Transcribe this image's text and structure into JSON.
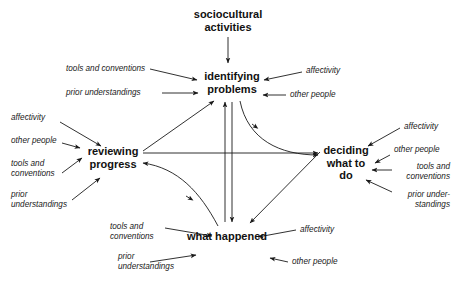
{
  "diagram": {
    "title_node": "sociocultural activities",
    "type": "cycle-diagram",
    "nodes": {
      "top": "sociocultural\nactivities",
      "identifying": "identifying\nproblems",
      "reviewing": "reviewing\nprogress",
      "deciding": "deciding\nwhat to\ndo",
      "happened": "what happened"
    },
    "node_lines": {
      "top_l1": "sociocultural",
      "top_l2": "activities",
      "identifying_l1": "identifying",
      "identifying_l2": "problems",
      "reviewing_l1": "reviewing",
      "reviewing_l2": "progress",
      "deciding_l1": "deciding",
      "deciding_l2": "what to",
      "deciding_l3": "do",
      "happened_l1": "what happened"
    },
    "influences": {
      "identifying_left": [
        "tools and conventions",
        "prior understandings"
      ],
      "identifying_right": [
        "affectivity",
        "other people"
      ],
      "reviewing_left": [
        "affectivity",
        "other people",
        "tools and",
        "conventions",
        "prior",
        "understandings"
      ],
      "deciding_right": [
        "affectivity",
        "other people",
        "tools and",
        "conventions",
        "prior under-",
        "standings"
      ],
      "happened_left": [
        "tools and",
        "conventions",
        "prior",
        "understandings"
      ],
      "happened_right": [
        "affectivity",
        "other people"
      ]
    },
    "colors": {
      "ink": "#111111",
      "line": "#1a1a1a",
      "background": "#ffffff"
    }
  }
}
